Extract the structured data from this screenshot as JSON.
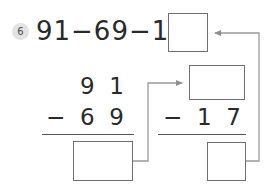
{
  "problem": {
    "number": "6",
    "equation": "91−69−17=",
    "equation_plain": "91-69-17="
  },
  "columns": {
    "left": {
      "minuend_digits": "9  1",
      "operator": "−",
      "subtrahend_digits": "6  9",
      "result": ""
    },
    "right": {
      "minuend": "",
      "operator": "−",
      "subtrahend_digits": "1  7",
      "result": ""
    }
  },
  "boxes": {
    "top_result": "",
    "mid_right_minuend": "",
    "bottom_left_result": "",
    "bottom_right_result": ""
  },
  "colors": {
    "ink": "#2a2a2a",
    "box_border": "#6f6f6f",
    "rule": "#555555",
    "connector": "#9a9a9a",
    "badge_bg": "#e2e2e2",
    "badge_text": "#4a4a4a",
    "page_bg": "#ffffff"
  },
  "connectors": [
    {
      "name": "left-result-to-right-minuend",
      "from": "bottom-left-result-box",
      "to": "mid-right-minuend-box",
      "arrowhead": "right"
    },
    {
      "name": "right-result-to-top-result",
      "from": "bottom-right-result-box",
      "to": "top-result-box",
      "arrowhead": "left"
    }
  ]
}
